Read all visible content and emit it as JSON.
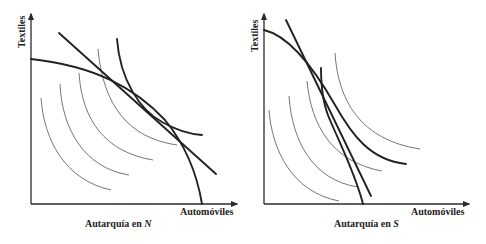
{
  "panels": [
    {
      "id": "north",
      "y_axis_label": "Textiles",
      "x_axis_label": "Automóviles",
      "caption_prefix": "Autarquía en ",
      "caption_country": "N",
      "elements": {
        "production_frontier": "concave, shallow slope at top, steep near x-axis",
        "price_line": "tangent line through autarky point",
        "indifference_curves": 5,
        "highest_indifference_curve_bold": true
      }
    },
    {
      "id": "south",
      "y_axis_label": "Textiles",
      "x_axis_label": "Automóviles",
      "caption_prefix": "Autarquía en ",
      "caption_country": "S",
      "elements": {
        "production_frontier": "concave, steep at bottom, flattens toward upper left",
        "price_line": "steep tangent line through autarky point",
        "indifference_curves": 5,
        "highest_indifference_curve_bold": true
      }
    }
  ]
}
